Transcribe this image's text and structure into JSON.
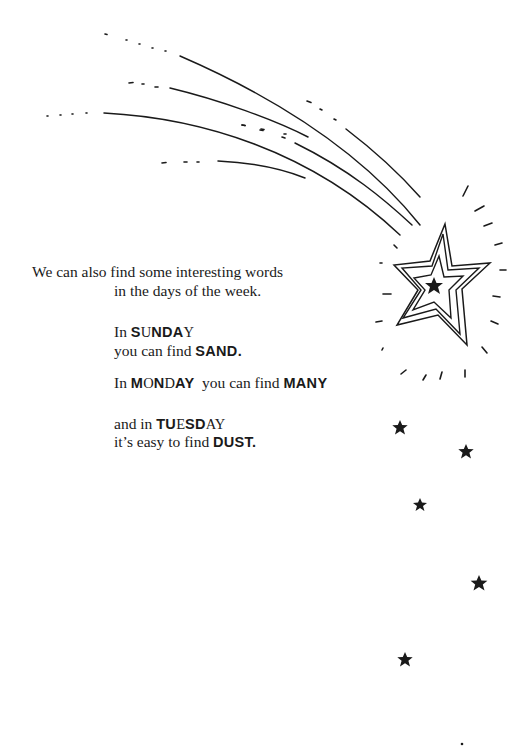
{
  "intro": {
    "line1": "We can also find some interesting words",
    "line2": "in the days of the week."
  },
  "sunday": {
    "prefix": "In ",
    "word_parts": [
      {
        "text": "S",
        "bold": true
      },
      {
        "text": "U",
        "bold": false
      },
      {
        "text": "NDA",
        "bold": true
      },
      {
        "text": "Y",
        "bold": false
      }
    ],
    "line2_prefix": "you can find ",
    "found_word": "SAND."
  },
  "monday": {
    "prefix": "In ",
    "word_parts": [
      {
        "text": "M",
        "bold": true
      },
      {
        "text": "O",
        "bold": false
      },
      {
        "text": "N",
        "bold": true
      },
      {
        "text": "D",
        "bold": false
      },
      {
        "text": "AY",
        "bold": true
      }
    ],
    "middle": "  you can find ",
    "found_word": "MANY"
  },
  "tuesday": {
    "prefix": "and in ",
    "word_parts": [
      {
        "text": "TU",
        "bold": true
      },
      {
        "text": "E",
        "bold": false
      },
      {
        "text": "SD",
        "bold": true
      },
      {
        "text": "AY",
        "bold": false
      }
    ],
    "line2_prefix": "it’s easy to find ",
    "found_word": "DUST."
  },
  "illustration": {
    "main": "shooting-star",
    "small_stars_count": 6,
    "ink_color": "#1a1a1a"
  }
}
